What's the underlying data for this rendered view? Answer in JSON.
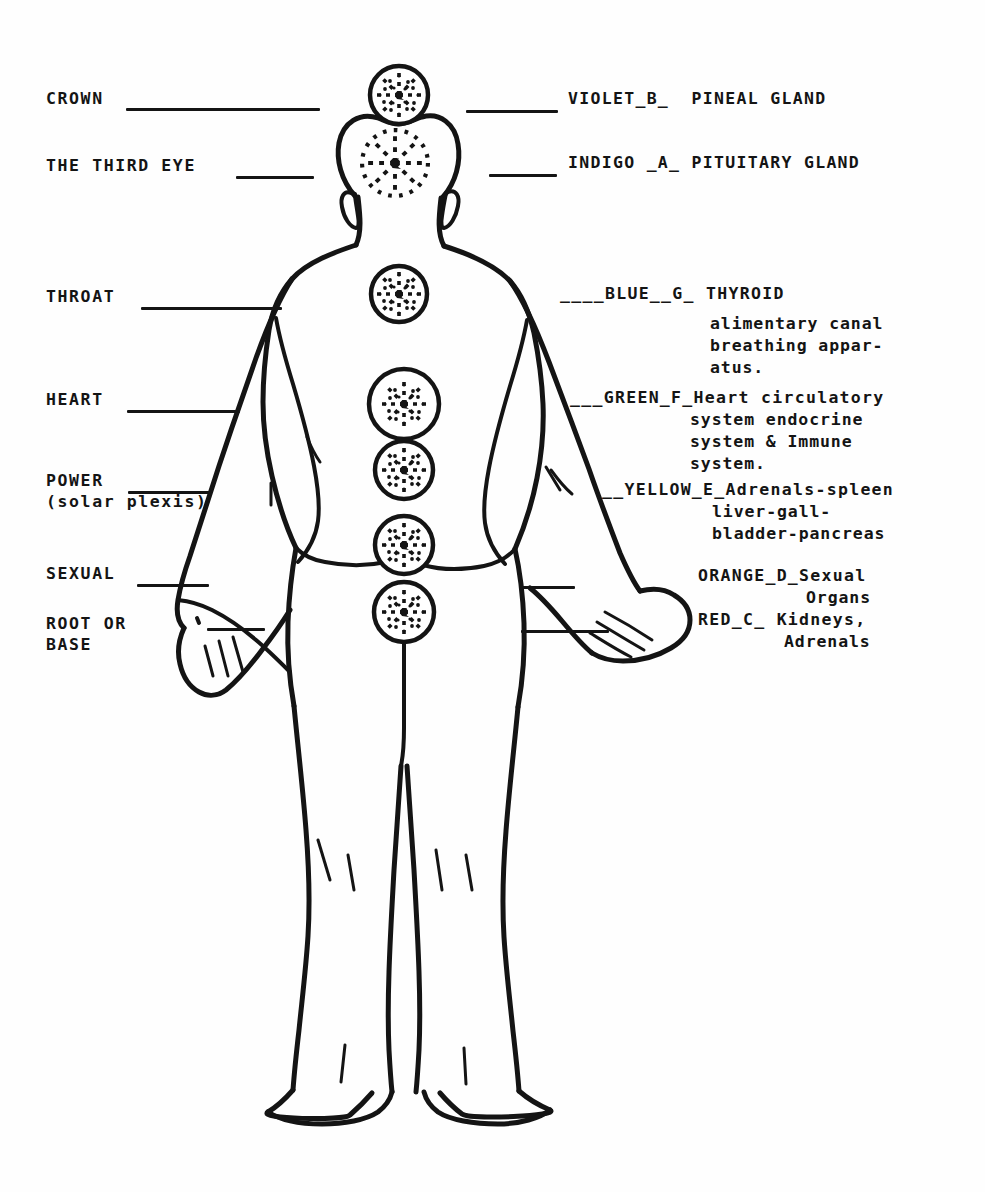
{
  "document": {
    "type": "chakra-worksheet",
    "background_color": "#fefefe",
    "ink_color": "#141414",
    "description": "Line drawing of a human figure seen from behind with seven chakra wheels along the spine, flanked by fill-in-the-blank labels."
  },
  "left_labels": [
    {
      "id": "crown",
      "line1": "CROWN",
      "line2": ""
    },
    {
      "id": "third-eye",
      "line1": "THE THIRD EYE",
      "line2": ""
    },
    {
      "id": "throat",
      "line1": "THROAT",
      "line2": ""
    },
    {
      "id": "heart",
      "line1": "HEART",
      "line2": ""
    },
    {
      "id": "power",
      "line1": "POWER",
      "line2": "(solar plexis)"
    },
    {
      "id": "sexual",
      "line1": "SEXUAL",
      "line2": ""
    },
    {
      "id": "root",
      "line1": "ROOT OR",
      "line2": "BASE"
    }
  ],
  "right_labels": [
    {
      "id": "violet",
      "heading": "VIOLET_B_  PINEAL GLAND",
      "color_word": "VIOLET",
      "note_letter": "B",
      "gland": "PINEAL GLAND",
      "detail_lines": []
    },
    {
      "id": "indigo",
      "heading": "INDIGO _A_ PITUITARY GLAND",
      "color_word": "INDIGO",
      "note_letter": "A",
      "gland": "PITUITARY GLAND",
      "detail_lines": []
    },
    {
      "id": "blue",
      "heading": "____BLUE__G_ THYROID",
      "color_word": "BLUE",
      "note_letter": "G",
      "gland": "THYROID",
      "detail_lines": [
        "alimentary canal",
        "breathing appar-",
        "atus."
      ]
    },
    {
      "id": "green",
      "heading": "___GREEN_F_Heart circulatory",
      "color_word": "GREEN",
      "note_letter": "F",
      "gland": "Heart",
      "detail_lines": [
        "system endocrine",
        "system & Immune",
        "system."
      ]
    },
    {
      "id": "yellow",
      "heading": "__YELLOW_E_Adrenals-spleen",
      "color_word": "YELLOW",
      "note_letter": "E",
      "gland": "Adrenals-spleen",
      "detail_lines": [
        "liver-gall-",
        "bladder-pancreas"
      ]
    },
    {
      "id": "orange",
      "heading": "ORANGE_D_Sexual",
      "color_word": "ORANGE",
      "note_letter": "D",
      "gland": "Sexual Organs",
      "detail_lines": [
        "Organs"
      ]
    },
    {
      "id": "red",
      "heading": "RED_C_ Kidneys,",
      "color_word": "RED",
      "note_letter": "C",
      "gland": "Kidneys, Adrenals",
      "detail_lines": [
        "Adrenals"
      ]
    }
  ],
  "chakras": [
    {
      "id": "crown-chakra",
      "label": "crown",
      "outlined": true,
      "cx": 399,
      "cy": 95,
      "r": 29
    },
    {
      "id": "third-eye-chakra",
      "label": "third-eye",
      "outlined": false,
      "cx": 395,
      "cy": 163,
      "r": 34
    },
    {
      "id": "throat-chakra",
      "label": "throat",
      "outlined": true,
      "cx": 399,
      "cy": 294,
      "r": 28
    },
    {
      "id": "heart-chakra",
      "label": "heart",
      "outlined": true,
      "cx": 404,
      "cy": 404,
      "r": 35
    },
    {
      "id": "solar-plexus-chakra",
      "label": "power",
      "outlined": true,
      "cx": 404,
      "cy": 470,
      "r": 29
    },
    {
      "id": "sexual-chakra",
      "label": "sexual",
      "outlined": true,
      "cx": 404,
      "cy": 545,
      "r": 29
    },
    {
      "id": "root-chakra",
      "label": "root",
      "outlined": true,
      "cx": 404,
      "cy": 612,
      "r": 30
    }
  ]
}
